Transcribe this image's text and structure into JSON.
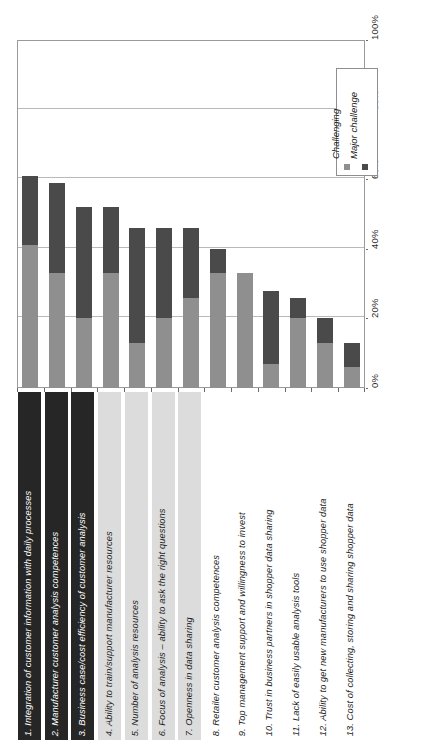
{
  "chart_data": {
    "type": "bar",
    "subtype": "stacked-horizontal-rotated",
    "title": "",
    "xlabel": "",
    "ylabel": "",
    "ylim": [
      0,
      100
    ],
    "value_axis_ticks": [
      "0%",
      "20%",
      "40%",
      "60%",
      "80%",
      "100%"
    ],
    "value_axis_tick_values": [
      0,
      20,
      40,
      60,
      80,
      100
    ],
    "grid": true,
    "legend_position": "right-inside",
    "categories": [
      "1. Integration of customer information with daily processes",
      "2. Manufacturer customer analysis competences",
      "3. Business case/cost efficiency of customer analysis",
      "4. Ability to train/support manufacturer resources",
      "5. Number of analysis resources",
      "6. Focus of analysis – ability to ask the right questions",
      "7. Openness in data sharing",
      "8. Retailer customer analysis competences",
      "9. Top management support and willingness to invest",
      "10. Trust in business partners in shopper data sharing",
      "11. Lack of easily usable analysis tools",
      "12. Ability to get new manufacturers to use shopper data",
      "13. Cost of collecting, storing and sharing shopper data"
    ],
    "category_label_styles": [
      "dark-box",
      "dark-box",
      "dark-box",
      "light-box",
      "light-box",
      "light-box",
      "light-box",
      "none",
      "none",
      "none",
      "none",
      "none",
      "none"
    ],
    "series": [
      {
        "name": "Challenging",
        "color": "#8f8f8f",
        "values": [
          41,
          33,
          20,
          33,
          13,
          20,
          26,
          33,
          33,
          7,
          20,
          13,
          6
        ]
      },
      {
        "name": "Major challenge",
        "color": "#4a4a4a",
        "values": [
          20,
          26,
          32,
          19,
          33,
          26,
          20,
          7,
          0,
          21,
          6,
          7,
          7
        ]
      }
    ],
    "totals": [
      61,
      59,
      52,
      52,
      46,
      46,
      46,
      40,
      33,
      28,
      26,
      20,
      13
    ]
  },
  "legend": {
    "entries": [
      {
        "label": "Challenging",
        "swatch": "light-gray-swatch"
      },
      {
        "label": "Major challenge",
        "swatch": "dark-gray-swatch"
      }
    ]
  },
  "colors": {
    "challenging": "#8f8f8f",
    "major_challenge": "#4a4a4a",
    "gridline": "#b9b9b9",
    "frame": "#9a9a9a",
    "dark_label_box": "#262626",
    "light_label_box": "#dcdcdc",
    "background": "#ffffff"
  }
}
